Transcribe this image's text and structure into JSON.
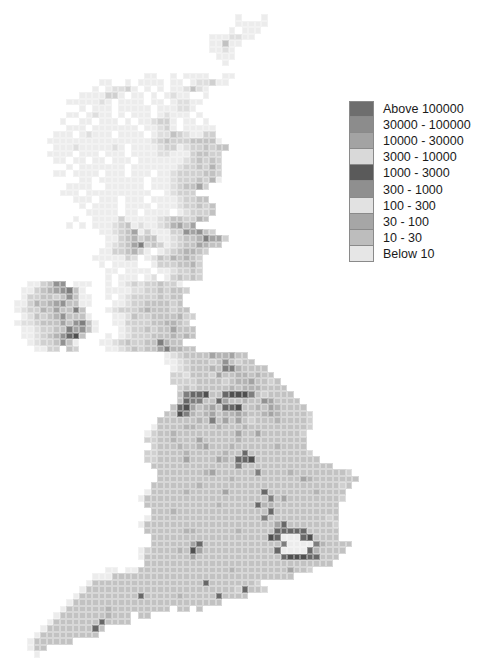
{
  "figure": {
    "type": "grid choropleth map",
    "region": "Great Britain and Ireland (10 km grid)"
  },
  "legend": {
    "items": [
      {
        "label": "Above 100000",
        "color": "#6e6e6e"
      },
      {
        "label": "30000 - 100000",
        "color": "#8c8c8c"
      },
      {
        "label": "10000 - 30000",
        "color": "#a3a3a3"
      },
      {
        "label": "3000 - 10000",
        "color": "#d9d9d9"
      },
      {
        "label": "1000 - 3000",
        "color": "#5a5a5a"
      },
      {
        "label": "300 - 1000",
        "color": "#8f8f8f"
      },
      {
        "label": "100 - 300",
        "color": "#e2e2e2"
      },
      {
        "label": "30 - 100",
        "color": "#a6a6a6"
      },
      {
        "label": "10 - 30",
        "color": "#bdbdbd"
      },
      {
        "label": "Below 10",
        "color": "#e6e6e6"
      }
    ]
  },
  "grid": {
    "cell_px": 6.5,
    "origin_x": 14,
    "origin_y": 14,
    "shade_by_code": {
      "0": "#ececec",
      "1": "#dedede",
      "2": "#d0d0d0",
      "3": "#c2c2c2",
      "4": "#b3b3b3",
      "5": "#a3a3a3",
      "6": "#929292",
      "7": "#7e7e7e",
      "8": "#676767",
      "9": "#4f4f4f"
    },
    "rows": [
      [
        34,
        "0...0"
      ],
      [
        34,
        "00000"
      ],
      [
        33,
        "0.000"
      ],
      [
        30,
        "0001100"
      ],
      [
        30,
        "00300."
      ],
      [
        30,
        "0010"
      ],
      [
        31,
        "000"
      ],
      [
        32,
        "0"
      ],
      [],
      [
        20,
        "00..0.0000..00"
      ],
      [
        13,
        "00..0.0000.00.011200"
      ],
      [
        12,
        "0.01120.0.0.001310"
      ],
      [
        10,
        "0000220.00.0.0100..0"
      ],
      [
        8,
        "0000010.0000.00.01100"
      ],
      [
        10,
        "0.000.00000.000110"
      ],
      [
        8,
        "00.0100.0.000.01000.0"
      ],
      [
        7,
        "0..00.000.0.001220.00.0"
      ],
      [
        8,
        "000.0000000.00120.00000"
      ],
      [
        6,
        "000.01000.0000.0113210022"
      ],
      [
        5,
        "000000000000000012322233330"
      ],
      [
        6,
        "00010000010.000012201223233"
      ],
      [
        5,
        "0000.000.000.00001100023322"
      ],
      [
        6,
        "00.00.00.000.0000000123232"
      ],
      [
        8,
        "0.0000000.00000001223242"
      ],
      [
        6,
        "00.0000.000.000.0012222332"
      ],
      [
        10,
        "00.0000000.00012223240"
      ],
      [
        8,
        "0000..000000.000123352"
      ],
      [
        7,
        "000.0000000000..01222"
      ],
      [
        9,
        "000.000.000.000012233"
      ],
      [
        10,
        "0.0000.0000.000122323"
      ],
      [
        11,
        "00000.00.0000.012223"
      ],
      [
        9,
        "0..000020000012332243"
      ],
      [
        8,
        "0.0.0001230100124535"
      ],
      [
        13,
        "001235020002265632"
      ],
      [
        14,
        "0023423300123347552"
      ],
      [
        14,
        "012357232012335433"
      ],
      [
        13,
        "00223420.01234432"
      ],
      [
        12,
        "0000021.013243432"
      ],
      [
        13,
        "0.0000..02223342"
      ],
      [
        14,
        "00.0000.0012232"
      ],
      [
        14,
        "0.000.01.023232"
      ],
      [
        2,
        "002366.000..0.0121223220"
      ],
      [
        1,
        "0023456730...0000112232332"
      ],
      [
        1,
        "02233236300..0.0122223233"
      ],
      [
        0,
        "002434563300...00122333323"
      ],
      [
        0,
        "01224353373...0122234333233"
      ],
      [
        1,
        "01323463330...0013223333422"
      ],
      [
        0,
        "0112333536730..002222334432"
      ],
      [
        1,
        "001223375630...012232335333"
      ],
      [
        1,
        "0012346893...0.012223334343"
      ],
      [
        2,
        "01223630...0012322337433"
      ],
      [
        3,
        "0022.32....00123233574433"
      ],
      [
        23,
        "0123333544533"
      ],
      [
        23,
        "00123332363233"
      ],
      [
        24,
        "012333437743333"
      ],
      [
        24,
        "2213332533443433"
      ],
      [
        24,
        "22223333234453323"
      ],
      [
        25,
        "23233333434443333"
      ],
      [
        25,
        "378893389997323333"
      ],
      [
        25,
        "3877338533433653333"
      ],
      [
        24,
        "389534538893343543333"
      ],
      [
        23,
        "33974345344543345433332"
      ],
      [
        22,
        "333333437353532333433332"
      ],
      [
        21,
        "0333344333433343333333332"
      ],
      [
        20,
        "0233433333333353353333332"
      ],
      [
        20,
        "2233433353333343333333333"
      ],
      [
        21,
        "233343345333433333343333"
      ],
      [
        20,
        "22333343333343383333333332"
      ],
      [
        20,
        "223333533335438893333333333"
      ],
      [
        21,
        "3333333333333733333333333333"
      ],
      [
        22,
        "333333345333333733334333333332"
      ],
      [
        22,
        "3333333333343333333333543333333"
      ],
      [
        21,
        "3333333433333333333333333333323"
      ],
      [
        20,
        "0333334333335333338333333343333"
      ],
      [
        19,
        "03333333333333333333735333333332"
      ],
      [
        20,
        "333333333334333338443333333333"
      ],
      [
        21,
        "33343333333333333383333333333"
      ],
      [
        20,
        "033333333333333333733333333323"
      ],
      [
        19,
        "0333333333333333333335833333332"
      ],
      [
        20,
        "333333443333334333338888833333"
      ],
      [
        21,
        "33333333333333333398000893333"
      ],
      [
        21,
        "3333335833333333333370000743333"
      ],
      [
        19,
        "02333343953333333333380000843333"
      ],
      [
        19,
        "0333333353333333333333899988333"
      ],
      [
        20,
        "33333333333333333333333333333"
      ],
      [
        14,
        "00.00333333333333334333333335332"
      ],
      [
        12,
        "0003333333333333333333333333333"
      ],
      [
        11,
        "033333333333333333833333332"
      ],
      [
        10,
        "03333333333333333333333328332"
      ],
      [
        9,
        "033333333383333343333383333"
      ],
      [
        8,
        "033333333333333333333333"
      ],
      [
        7,
        "03333334333333333.33.3"
      ],
      [
        6,
        "033333334333.33"
      ],
      [
        5,
        "0333333383333"
      ],
      [
        4,
        "0333333383"
      ],
      [
        3,
        "0333333333"
      ],
      [
        2,
        "0333333"
      ],
      [
        2,
        "033"
      ],
      [
        3,
        "0"
      ]
    ]
  }
}
